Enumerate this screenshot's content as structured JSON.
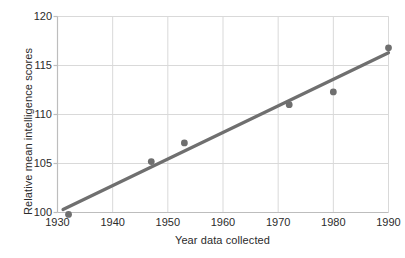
{
  "chart_data": {
    "type": "scatter",
    "title": "",
    "xlabel": "Year data collected",
    "ylabel": "Relative mean intelligence scores",
    "xlim": [
      1930,
      1990
    ],
    "ylim": [
      100,
      120
    ],
    "xticks": [
      1930,
      1940,
      1950,
      1960,
      1970,
      1980,
      1990
    ],
    "yticks": [
      100,
      105,
      110,
      115,
      120
    ],
    "grid": true,
    "legend": null,
    "marker_color": "#6f6f6f",
    "line_color": "#6f6f6f",
    "grid_color": "#d9d9d9",
    "axis_color": "#bdbdbd",
    "background": "#ffffff",
    "points": [
      {
        "x": 1932,
        "y": 99.8
      },
      {
        "x": 1947,
        "y": 105.2
      },
      {
        "x": 1953,
        "y": 107.1
      },
      {
        "x": 1972,
        "y": 111.0
      },
      {
        "x": 1980,
        "y": 112.3
      },
      {
        "x": 1990,
        "y": 116.8
      }
    ],
    "series": [
      {
        "name": "Relative mean intelligence scores",
        "x": [
          1932,
          1947,
          1953,
          1972,
          1980,
          1990
        ],
        "values": [
          99.8,
          105.2,
          107.1,
          111.0,
          112.3,
          116.8
        ]
      }
    ],
    "trend_line": {
      "name": "linear fit",
      "x_start": 1931,
      "y_start": 100.3,
      "x_end": 1990,
      "y_end": 116.3
    }
  },
  "axes": {
    "x_tick_labels": [
      "1930",
      "1940",
      "1950",
      "1960",
      "1970",
      "1980",
      "1990"
    ],
    "y_tick_labels": [
      "100",
      "105",
      "110",
      "115",
      "120"
    ],
    "x_axis_title": "Year data collected",
    "y_axis_title": "Relative mean intelligence scores"
  }
}
